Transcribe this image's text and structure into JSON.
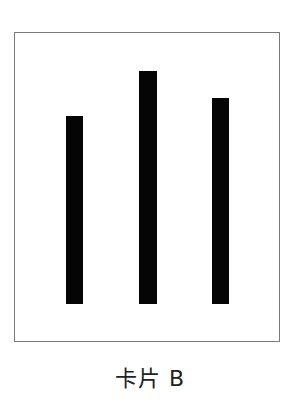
{
  "card": {
    "label": "卡片 B",
    "border_color": "#7a7a7a",
    "bar_color": "#050505",
    "bars": [
      {
        "name": "bar-1",
        "left": 66,
        "top": 116,
        "width": 17,
        "height": 188
      },
      {
        "name": "bar-2",
        "left": 139,
        "top": 71,
        "width": 18,
        "height": 233
      },
      {
        "name": "bar-3",
        "left": 212,
        "top": 98,
        "width": 17,
        "height": 206
      }
    ]
  }
}
